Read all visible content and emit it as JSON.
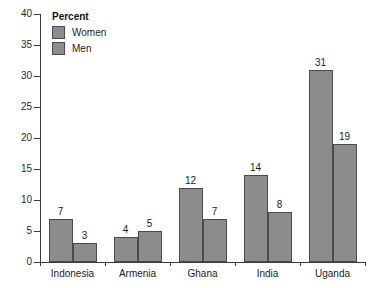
{
  "chart_data": {
    "type": "bar",
    "title": "",
    "xlabel": "",
    "ylabel": "Percent",
    "ylim": [
      0,
      40
    ],
    "yticks": [
      0,
      5,
      10,
      15,
      20,
      25,
      30,
      35,
      40
    ],
    "ytick_labels": [
      "0",
      "5",
      "10",
      "15",
      "20",
      "25",
      "30",
      "35",
      "40"
    ],
    "grid": false,
    "legend_position": "top-left",
    "legend_title": "Percent",
    "categories": [
      "Indonesia",
      "Armenia",
      "Ghana",
      "India",
      "Uganda"
    ],
    "series": [
      {
        "name": "Women",
        "color": "#8c8c8c",
        "values": [
          7,
          4,
          12,
          14,
          31
        ],
        "labels": [
          "7",
          "4",
          "12",
          "14",
          "31"
        ]
      },
      {
        "name": "Men",
        "color": "#8c8c8c",
        "values": [
          3,
          5,
          7,
          8,
          19
        ],
        "labels": [
          "3",
          "5",
          "7",
          "8",
          "19"
        ]
      }
    ]
  },
  "legend": {
    "title": "Percent",
    "entries": [
      {
        "label": "Women"
      },
      {
        "label": "Men"
      }
    ]
  },
  "axes": {
    "y_ticks": [
      "40",
      "35",
      "30",
      "25",
      "20",
      "15",
      "10",
      "5",
      "0"
    ],
    "x_labels": [
      "Indonesia",
      "Armenia",
      "Ghana",
      "India",
      "Uganda"
    ]
  },
  "colors": {
    "bar_fill": "#8c8c8c",
    "bar_stroke": "#4a4a4a",
    "axis": "#3a3a3a",
    "text": "#1b1b1b",
    "background": "#ffffff"
  }
}
